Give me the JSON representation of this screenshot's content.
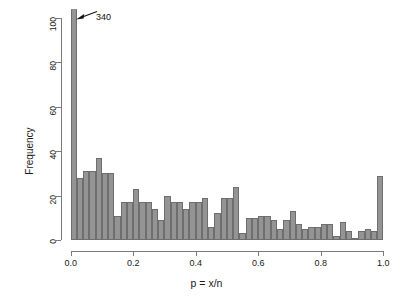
{
  "chart_data": {
    "type": "bar",
    "title": "",
    "subtitle": "",
    "xlabel": "p = x/n",
    "ylabel": "Frequency",
    "xlim": [
      0.0,
      1.0
    ],
    "ylim": [
      0,
      104
    ],
    "grid": false,
    "legend": null,
    "bin_width": 0.02,
    "bar_color": "#949494",
    "bar_border_color": "#6e6e6e",
    "axis_color": "#7a7a7a",
    "text_color": "#1a1a1a",
    "x_ticks": [
      {
        "value": 0.0,
        "label": "0.0"
      },
      {
        "value": 0.2,
        "label": "0.2"
      },
      {
        "value": 0.4,
        "label": "0.4"
      },
      {
        "value": 0.6,
        "label": "0.6"
      },
      {
        "value": 0.8,
        "label": "0.8"
      },
      {
        "value": 1.0,
        "label": "1.0"
      }
    ],
    "y_ticks": [
      {
        "value": 0,
        "label": "0"
      },
      {
        "value": 20,
        "label": "20"
      },
      {
        "value": 40,
        "label": "40"
      },
      {
        "value": 60,
        "label": "60"
      },
      {
        "value": 80,
        "label": "80"
      },
      {
        "value": 100,
        "label": "100"
      }
    ],
    "bins": [
      {
        "x0": 0.0,
        "x1": 0.02,
        "value": 340,
        "clipped": true,
        "display_value": 104
      },
      {
        "x0": 0.02,
        "x1": 0.04,
        "value": 28
      },
      {
        "x0": 0.04,
        "x1": 0.06,
        "value": 31
      },
      {
        "x0": 0.06,
        "x1": 0.08,
        "value": 31
      },
      {
        "x0": 0.08,
        "x1": 0.1,
        "value": 37
      },
      {
        "x0": 0.1,
        "x1": 0.12,
        "value": 30
      },
      {
        "x0": 0.12,
        "x1": 0.14,
        "value": 30
      },
      {
        "x0": 0.14,
        "x1": 0.16,
        "value": 11
      },
      {
        "x0": 0.16,
        "x1": 0.18,
        "value": 17
      },
      {
        "x0": 0.18,
        "x1": 0.2,
        "value": 17
      },
      {
        "x0": 0.2,
        "x1": 0.22,
        "value": 23
      },
      {
        "x0": 0.22,
        "x1": 0.24,
        "value": 17
      },
      {
        "x0": 0.24,
        "x1": 0.26,
        "value": 17
      },
      {
        "x0": 0.26,
        "x1": 0.28,
        "value": 14
      },
      {
        "x0": 0.28,
        "x1": 0.3,
        "value": 9
      },
      {
        "x0": 0.3,
        "x1": 0.32,
        "value": 20
      },
      {
        "x0": 0.32,
        "x1": 0.34,
        "value": 17
      },
      {
        "x0": 0.34,
        "x1": 0.36,
        "value": 17
      },
      {
        "x0": 0.36,
        "x1": 0.38,
        "value": 14
      },
      {
        "x0": 0.38,
        "x1": 0.4,
        "value": 17
      },
      {
        "x0": 0.4,
        "x1": 0.42,
        "value": 17
      },
      {
        "x0": 0.42,
        "x1": 0.44,
        "value": 19
      },
      {
        "x0": 0.44,
        "x1": 0.46,
        "value": 6
      },
      {
        "x0": 0.46,
        "x1": 0.48,
        "value": 12
      },
      {
        "x0": 0.48,
        "x1": 0.5,
        "value": 19
      },
      {
        "x0": 0.5,
        "x1": 0.52,
        "value": 19
      },
      {
        "x0": 0.52,
        "x1": 0.54,
        "value": 24
      },
      {
        "x0": 0.54,
        "x1": 0.56,
        "value": 3
      },
      {
        "x0": 0.56,
        "x1": 0.58,
        "value": 10
      },
      {
        "x0": 0.58,
        "x1": 0.6,
        "value": 10
      },
      {
        "x0": 0.6,
        "x1": 0.62,
        "value": 11
      },
      {
        "x0": 0.62,
        "x1": 0.64,
        "value": 11
      },
      {
        "x0": 0.64,
        "x1": 0.66,
        "value": 9
      },
      {
        "x0": 0.66,
        "x1": 0.68,
        "value": 5
      },
      {
        "x0": 0.68,
        "x1": 0.7,
        "value": 9
      },
      {
        "x0": 0.7,
        "x1": 0.72,
        "value": 13
      },
      {
        "x0": 0.72,
        "x1": 0.74,
        "value": 7
      },
      {
        "x0": 0.74,
        "x1": 0.76,
        "value": 5
      },
      {
        "x0": 0.76,
        "x1": 0.78,
        "value": 6
      },
      {
        "x0": 0.78,
        "x1": 0.8,
        "value": 6
      },
      {
        "x0": 0.8,
        "x1": 0.82,
        "value": 7
      },
      {
        "x0": 0.82,
        "x1": 0.84,
        "value": 7
      },
      {
        "x0": 0.84,
        "x1": 0.86,
        "value": 2
      },
      {
        "x0": 0.86,
        "x1": 0.88,
        "value": 8
      },
      {
        "x0": 0.88,
        "x1": 0.9,
        "value": 4
      },
      {
        "x0": 0.9,
        "x1": 0.92,
        "value": 1
      },
      {
        "x0": 0.92,
        "x1": 0.94,
        "value": 4
      },
      {
        "x0": 0.94,
        "x1": 0.96,
        "value": 5
      },
      {
        "x0": 0.96,
        "x1": 0.98,
        "value": 4
      },
      {
        "x0": 0.98,
        "x1": 1.0,
        "value": 29
      }
    ],
    "annotations": [
      {
        "text": "340",
        "points_to_bin": 0,
        "kind": "arrow-label",
        "note": "first bar is truncated; true count is 340"
      }
    ]
  }
}
